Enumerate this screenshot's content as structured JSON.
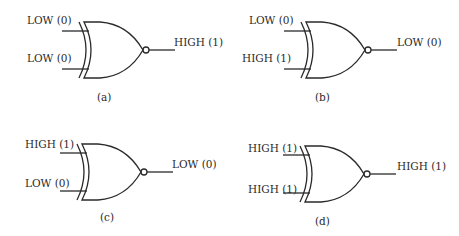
{
  "figure": {
    "type": "XNOR gate truth examples",
    "panels": [
      {
        "id": "a",
        "caption": "(a)",
        "input_a": "LOW (0)",
        "input_b": "LOW (0)",
        "output": "HIGH (1)",
        "origin": {
          "x": 0,
          "y": 0
        }
      },
      {
        "id": "b",
        "caption": "(b)",
        "input_a": "LOW (0)",
        "input_b": "HIGH (1)",
        "output": "LOW (0)",
        "origin": {
          "x": 222,
          "y": 0
        }
      },
      {
        "id": "c",
        "caption": "(c)",
        "input_a": "HIGH (1)",
        "input_b": "LOW (0)",
        "output": "LOW (0)",
        "origin": {
          "x": -2,
          "y": 122
        }
      },
      {
        "id": "d",
        "caption": "(d)",
        "input_a": "HIGH (1)",
        "input_b": "HIGH (1)",
        "output": "HIGH (1)",
        "origin": {
          "x": 221,
          "y": 124
        }
      }
    ]
  },
  "colors": {
    "stroke": "#2a2a2a",
    "text": "#2a2a2a",
    "background": "#ffffff"
  }
}
